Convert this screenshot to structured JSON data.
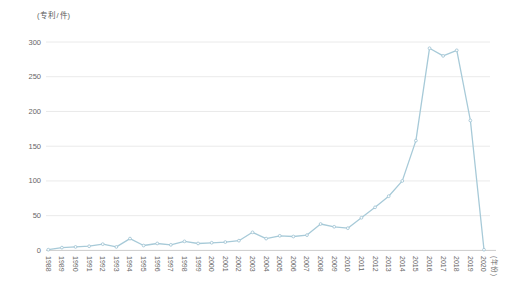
{
  "chart": {
    "y_unit_label": "(专利/件)",
    "x_unit_label": "(年份)"
  },
  "chart_data": {
    "type": "line",
    "title": "",
    "xlabel": "(年份)",
    "ylabel": "(专利/件)",
    "x": [
      "1988",
      "1989",
      "1990",
      "1991",
      "1992",
      "1993",
      "1994",
      "1995",
      "1996",
      "1997",
      "1998",
      "1999",
      "2000",
      "2001",
      "2002",
      "2003",
      "2004",
      "2005",
      "2006",
      "2007",
      "2008",
      "2009",
      "2010",
      "2011",
      "2012",
      "2013",
      "2014",
      "2015",
      "2016",
      "2017",
      "2018",
      "2019",
      "2020"
    ],
    "series": [
      {
        "name": "专利数量",
        "values": [
          1,
          4,
          5,
          6,
          9,
          5,
          17,
          7,
          10,
          8,
          13,
          10,
          11,
          12,
          14,
          26,
          17,
          21,
          20,
          22,
          38,
          34,
          32,
          47,
          62,
          78,
          100,
          158,
          291,
          280,
          288,
          187,
          1
        ]
      }
    ],
    "ylim": [
      0,
      300
    ],
    "yticks": [
      0,
      50,
      100,
      150,
      200,
      250,
      300
    ],
    "grid": "horizontal",
    "legend_position": "none",
    "colors": {
      "line": "#a7cad8",
      "marker_fill": "#fcfdfe",
      "marker_stroke": "#9dc2d2",
      "grid": "#eaeaea",
      "axis": "#cccccc",
      "tick_text": "#666666"
    }
  }
}
